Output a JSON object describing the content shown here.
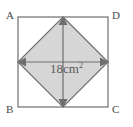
{
  "figure": {
    "background_color": "#ffffff",
    "square": {
      "stroke_color": "#6e6e6e",
      "fill_color": "#ffffff",
      "corners": {
        "top_left_label": "A",
        "top_right_label": "D",
        "bottom_left_label": "B",
        "bottom_right_label": "C"
      }
    },
    "inner_diamond": {
      "fill_color": "#d6d6d6",
      "stroke_color": "#6e6e6e",
      "description": "shaded square joining midpoints of the outer square's sides"
    },
    "diagonals": {
      "stroke_color": "#6e6e6e",
      "arrowheads": "double-headed",
      "vertical_name": "vertical-diagonal",
      "horizontal_name": "horizontal-diagonal"
    },
    "area_label": {
      "value": "18",
      "unit": "cm",
      "exponent": "2",
      "full_text": "18cm²",
      "color": "#5a5a5a"
    }
  }
}
